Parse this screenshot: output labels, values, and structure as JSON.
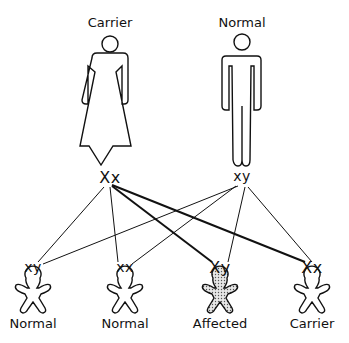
{
  "parents": [
    {
      "label": "Carrier",
      "genotype": "Xx",
      "figure": "female-icon",
      "x": 110
    },
    {
      "label": "Normal",
      "genotype": "xy",
      "figure": "male-icon",
      "x": 242
    }
  ],
  "children": [
    {
      "genotype": "xy",
      "label": "Normal",
      "x": 33,
      "affected": false
    },
    {
      "genotype": "xx",
      "label": "Normal",
      "x": 125,
      "affected": false
    },
    {
      "genotype": "Xy",
      "label": "Affected",
      "x": 220,
      "affected": true
    },
    {
      "genotype": "Xx",
      "label": "Carrier",
      "x": 312,
      "affected": false
    }
  ],
  "colors": {
    "line": "#111111",
    "affected_fill": "#bdbdbd"
  }
}
